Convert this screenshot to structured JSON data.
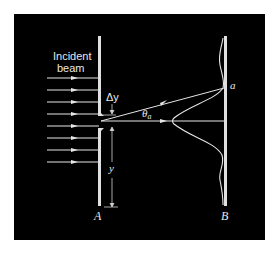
{
  "figure": {
    "background": "#000000",
    "line_color": "#e6e6e6",
    "incident_label_line1": "Incident",
    "incident_label_line2": "beam",
    "delta_y_label": "Δy",
    "y_label": "y",
    "theta_label": "θ",
    "theta_subscript": "a",
    "point_label": "a",
    "slit_wall_label": "A",
    "screen_label": "B",
    "incident_ray_count": 8
  }
}
